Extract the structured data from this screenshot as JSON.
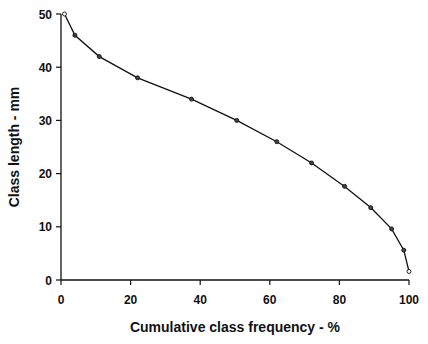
{
  "chart_data": {
    "type": "line",
    "title": "",
    "xlabel": "Cumulative class frequency - %",
    "ylabel": "Class length - mm",
    "xlim": [
      0,
      100
    ],
    "ylim": [
      0,
      50
    ],
    "x_ticks": [
      0,
      20,
      40,
      60,
      80,
      100
    ],
    "y_ticks": [
      0,
      10,
      20,
      30,
      40,
      50
    ],
    "grid": false,
    "legend": null,
    "series": [
      {
        "name": "Class length",
        "x": [
          1,
          4,
          11,
          22,
          37.5,
          50.5,
          62,
          72,
          81.5,
          89,
          95,
          98.5,
          100
        ],
        "y": [
          50,
          46,
          42,
          38,
          34,
          30,
          26,
          22,
          17.6,
          13.6,
          9.6,
          5.6,
          1.6
        ]
      }
    ]
  },
  "style": {
    "line_color": "#111111",
    "axis_color": "#111111",
    "background": "#ffffff"
  }
}
